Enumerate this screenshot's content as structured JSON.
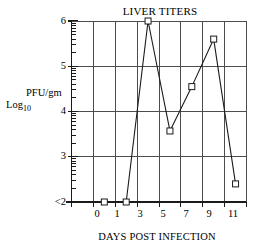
{
  "chart_data": {
    "type": "line",
    "title": "LIVER TITERS",
    "xlabel": "DAYS POST INFECTION",
    "ylabel": "Log10 PFU/gm",
    "ylabel_parts": {
      "log": "Log",
      "log_subscript": "10",
      "units": "PFU/gm"
    },
    "x": [
      0,
      1,
      3,
      5,
      7,
      9,
      11
    ],
    "xtick_labels": [
      "0",
      "1",
      "3",
      "5",
      "7",
      "9",
      "11"
    ],
    "values": [
      2.0,
      2.0,
      6.0,
      3.57,
      4.55,
      5.6,
      2.4
    ],
    "point_labels": [
      "<2",
      "<2",
      "6.0",
      "3.57",
      "4.55",
      "5.6",
      "2.4"
    ],
    "ytick_labels": [
      "<2",
      "3",
      "4",
      "5",
      "6"
    ],
    "ytick_values": [
      2,
      3,
      4,
      5,
      6
    ],
    "ylim": [
      2,
      6
    ],
    "xlim": [
      -1,
      12
    ],
    "grid": true,
    "legend": null,
    "marker": "open-square",
    "line_color": "#1a1a1a",
    "grid_color": "#4d4d4d",
    "background_color": "#ffffff",
    "minor_ticks": true,
    "minor_ticks_per_major": 10,
    "censored_note": "Values at day 0 and day 1 are below the limit of detection (<2)"
  },
  "axes": {
    "title": "LIVER TITERS",
    "x_title": "DAYS POST INFECTION",
    "y_title_units": "PFU/gm",
    "y_title_log": "Log",
    "y_title_log_sub": "10"
  }
}
